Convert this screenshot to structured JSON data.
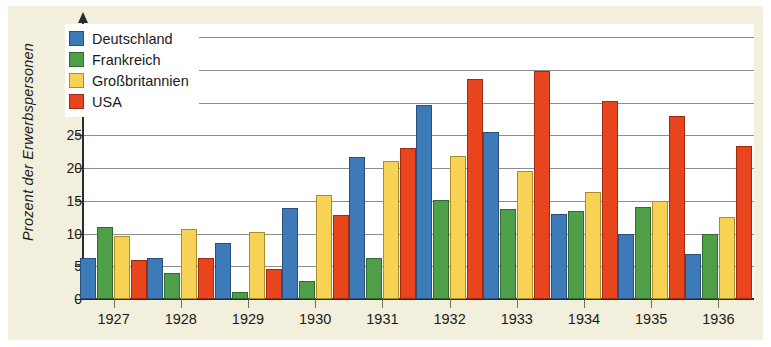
{
  "chart_data": {
    "type": "bar",
    "title": "",
    "subtitle": "",
    "xlabel": "",
    "ylabel": "Prozent der Erwerbspersonen",
    "categories": [
      "1927",
      "1928",
      "1929",
      "1930",
      "1931",
      "1932",
      "1933",
      "1934",
      "1935",
      "1936"
    ],
    "series": [
      {
        "name": "Deutschland",
        "color": "#3d7ab8",
        "values": [
          6.2,
          6.3,
          8.5,
          13.9,
          21.7,
          29.6,
          25.5,
          13.0,
          9.9,
          6.9
        ]
      },
      {
        "name": "Frankreich",
        "color": "#4f9e48",
        "values": [
          11.0,
          4.0,
          1.0,
          2.8,
          6.3,
          15.1,
          13.8,
          13.4,
          14.1,
          9.9
        ]
      },
      {
        "name": "Großbritannien",
        "color": "#f7d254",
        "values": [
          9.7,
          10.7,
          10.3,
          15.9,
          21.1,
          21.8,
          19.5,
          16.3,
          15.0,
          12.5
        ]
      },
      {
        "name": "USA",
        "color": "#e8441d",
        "values": [
          5.9,
          6.3,
          4.6,
          12.8,
          23.1,
          33.6,
          34.9,
          30.2,
          27.9,
          23.3
        ]
      }
    ],
    "ylim": [
      0,
      42
    ],
    "yticks": [
      0,
      5,
      10,
      15,
      20,
      25,
      30,
      35,
      40
    ],
    "ytick_labels": [
      "0",
      "5",
      "10",
      "15",
      "20",
      "25",
      "30",
      "35",
      "40"
    ],
    "grid": true,
    "grid_axis": "y",
    "legend_position": "top-left",
    "legend_entries": [
      "Deutschland",
      "Frankreich",
      "Großbritannien",
      "USA"
    ],
    "background_color": "#f2f0dd",
    "plot_background_color": "#ffffff"
  }
}
